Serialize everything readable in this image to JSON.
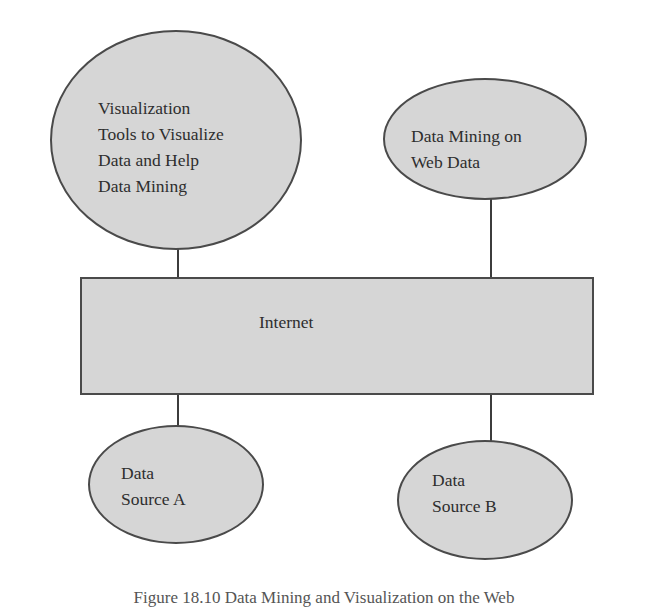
{
  "diagram": {
    "nodes": {
      "visualization_tools": {
        "shape": "ellipse",
        "lines": [
          "Visualization",
          "Tools to Visualize",
          "Data and Help",
          "Data Mining"
        ]
      },
      "web_data_mining": {
        "shape": "ellipse",
        "lines": [
          "Data Mining on",
          "Web Data"
        ]
      },
      "internet": {
        "shape": "rectangle",
        "label": "Internet"
      },
      "data_source_a": {
        "shape": "ellipse",
        "lines": [
          "Data",
          "Source A"
        ]
      },
      "data_source_b": {
        "shape": "ellipse",
        "lines": [
          "Data",
          "Source B"
        ]
      }
    },
    "edges": [
      {
        "from": "visualization_tools",
        "to": "internet"
      },
      {
        "from": "web_data_mining",
        "to": "internet"
      },
      {
        "from": "internet",
        "to": "data_source_a"
      },
      {
        "from": "internet",
        "to": "data_source_b"
      }
    ],
    "caption": "Figure 18.10 Data Mining and Visualization on the Web"
  },
  "colors": {
    "node_fill": "#d6d6d6",
    "node_stroke": "#4a4a4a",
    "text": "#2e2e2e",
    "background": "#ffffff"
  }
}
